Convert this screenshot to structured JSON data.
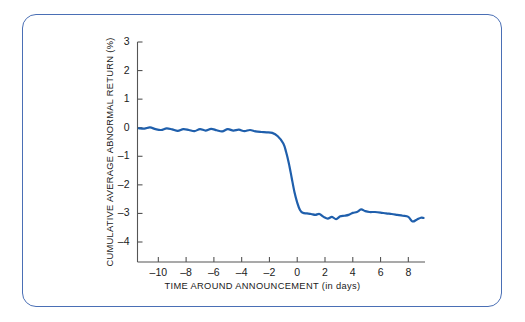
{
  "figure": {
    "border_color": "#4a6fb5",
    "background": "#ffffff"
  },
  "chart_data": {
    "type": "line",
    "title": "",
    "subtitle": "",
    "xlabel": "TIME AROUND ANNOUNCEMENT (in days)",
    "ylabel": "CUMULATIVE AVERAGE ABNORMAL RETURN (%)",
    "xlim": [
      -11.5,
      9.2
    ],
    "ylim": [
      -4.7,
      3.0
    ],
    "xticks": [
      -10,
      -8,
      -6,
      -4,
      -2,
      0,
      2,
      4,
      6,
      8
    ],
    "xtick_labels": [
      "–10",
      "–8",
      "–6",
      "–4",
      "–2",
      "0",
      "2",
      "4",
      "6",
      "8"
    ],
    "yticks": [
      3,
      2,
      1,
      0,
      -1,
      -2,
      -3,
      -4
    ],
    "ytick_labels": [
      "3",
      "2",
      "1",
      "0",
      "–1",
      "–2",
      "–3",
      "–4"
    ],
    "grid": false,
    "legend": null,
    "annotations": [],
    "series": [
      {
        "name": "Cumulative average abnormal return",
        "color": "#1f5fac",
        "line_width": 2.2,
        "x": [
          -11.4,
          -11.0,
          -10.6,
          -10.2,
          -9.8,
          -9.4,
          -9.0,
          -8.6,
          -8.2,
          -7.8,
          -7.4,
          -7.0,
          -6.6,
          -6.2,
          -5.8,
          -5.4,
          -5.0,
          -4.6,
          -4.2,
          -3.8,
          -3.4,
          -3.0,
          -2.6,
          -2.2,
          -1.8,
          -1.4,
          -1.0,
          -0.8,
          -0.6,
          -0.4,
          -0.2,
          0.0,
          0.2,
          0.4,
          0.7,
          1.0,
          1.3,
          1.6,
          1.9,
          2.2,
          2.5,
          2.8,
          3.1,
          3.4,
          3.7,
          4.0,
          4.3,
          4.6,
          4.9,
          5.2,
          5.6,
          6.0,
          6.4,
          6.8,
          7.2,
          7.6,
          8.0,
          8.3,
          8.6,
          8.9,
          9.1
        ],
        "y": [
          -0.02,
          -0.03,
          0.01,
          -0.05,
          -0.08,
          -0.02,
          -0.06,
          -0.11,
          -0.05,
          -0.08,
          -0.12,
          -0.05,
          -0.1,
          -0.04,
          -0.09,
          -0.13,
          -0.05,
          -0.1,
          -0.07,
          -0.12,
          -0.08,
          -0.13,
          -0.15,
          -0.16,
          -0.18,
          -0.3,
          -0.55,
          -0.85,
          -1.25,
          -1.75,
          -2.25,
          -2.62,
          -2.88,
          -2.98,
          -3.0,
          -3.02,
          -3.05,
          -3.02,
          -3.12,
          -3.18,
          -3.12,
          -3.2,
          -3.1,
          -3.08,
          -3.05,
          -2.98,
          -2.95,
          -2.86,
          -2.92,
          -2.95,
          -2.95,
          -2.97,
          -3.0,
          -3.02,
          -3.05,
          -3.08,
          -3.12,
          -3.28,
          -3.22,
          -3.15,
          -3.16
        ]
      }
    ]
  }
}
